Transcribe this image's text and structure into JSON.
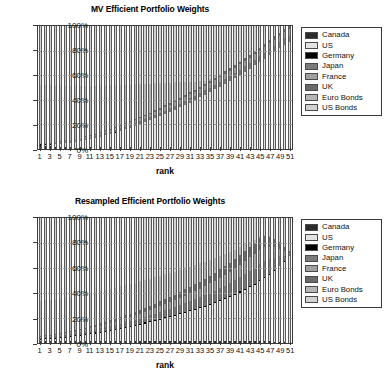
{
  "figure": {
    "xlabel": "rank",
    "yticks": [
      "0%",
      "20%",
      "40%",
      "60%",
      "80%",
      "100%"
    ],
    "xticks": [
      "1",
      "3",
      "5",
      "7",
      "9",
      "11",
      "13",
      "15",
      "17",
      "19",
      "21",
      "23",
      "25",
      "27",
      "29",
      "31",
      "33",
      "35",
      "37",
      "39",
      "41",
      "43",
      "45",
      "47",
      "49",
      "51"
    ],
    "legend_labels": [
      "Canada",
      "US",
      "Germany",
      "Japan",
      "France",
      "UK",
      "Euro Bonds",
      "US Bonds"
    ],
    "legend_colors": [
      "#2b2b2b",
      "#e3e3e3",
      "#000000",
      "#7a7a7a",
      "#a0a0a0",
      "#6a6a6a",
      "#b5b5b5",
      "#d2d2d2"
    ]
  },
  "chart_data": [
    {
      "type": "bar",
      "stacked": true,
      "title": "MV Efficient Portfolio Weights",
      "xlabel": "rank",
      "ylabel": "",
      "ylim": [
        0,
        100
      ],
      "yticks": [
        0,
        20,
        40,
        60,
        80,
        100
      ],
      "ytick_labels": [
        "0%",
        "20%",
        "40%",
        "60%",
        "80%",
        "100%"
      ],
      "grid": true,
      "legend_position": "right-outside",
      "x": [
        1,
        2,
        3,
        4,
        5,
        6,
        7,
        8,
        9,
        10,
        11,
        12,
        13,
        14,
        15,
        16,
        17,
        18,
        19,
        20,
        21,
        22,
        23,
        24,
        25,
        26,
        27,
        28,
        29,
        30,
        31,
        32,
        33,
        34,
        35,
        36,
        37,
        38,
        39,
        40,
        41,
        42,
        43,
        44,
        45,
        46,
        47,
        48,
        49,
        50,
        51
      ],
      "series": [
        {
          "name": "Canada",
          "color": "#2b2b2b",
          "values": [
            3.0,
            2.6,
            2.3,
            2.0,
            1.7,
            1.4,
            1.1,
            0.8,
            0.5,
            0.3,
            0.1,
            0,
            0,
            0,
            0,
            0,
            0,
            0,
            0,
            0,
            0,
            0,
            0,
            0,
            0,
            0,
            0,
            0,
            0,
            0,
            0,
            0,
            0,
            0,
            0,
            0,
            0,
            0,
            0,
            0,
            0,
            0,
            0,
            0,
            0,
            0,
            0,
            0,
            0,
            0,
            0
          ]
        },
        {
          "name": "US",
          "color": "#e3e3e3",
          "values": [
            0.6,
            0.9,
            1.3,
            1.8,
            2.4,
            3.1,
            3.9,
            4.8,
            5.7,
            6.7,
            7.7,
            8.8,
            9.9,
            11.0,
            12.2,
            13.4,
            14.7,
            16.0,
            17.4,
            18.8,
            20.3,
            21.8,
            23.4,
            25.0,
            26.7,
            28.4,
            30.2,
            32.0,
            33.9,
            35.8,
            37.8,
            39.8,
            41.9,
            44.0,
            46.2,
            48.4,
            50.7,
            53.0,
            55.4,
            57.8,
            60.3,
            62.8,
            65.4,
            68.0,
            70.7,
            73.4,
            76.2,
            79.0,
            81.9,
            84.8,
            87.8
          ]
        },
        {
          "name": "Germany",
          "color": "#000000",
          "values": [
            0.4,
            0.4,
            0.4,
            0.4,
            0.4,
            0.4,
            0.3,
            0.3,
            0.3,
            0.3,
            0.2,
            0.2,
            0.2,
            0.2,
            0.2,
            0.1,
            0.1,
            0.1,
            0.1,
            0.1,
            0,
            0,
            0,
            0,
            0,
            0,
            0,
            0,
            0,
            0,
            0,
            0,
            0,
            0,
            0,
            0,
            0,
            0,
            0,
            0,
            0,
            0,
            0,
            0,
            0,
            0,
            0,
            0,
            0,
            0,
            0
          ]
        },
        {
          "name": "Japan",
          "color": "#7a7a7a",
          "values": [
            0.3,
            0.4,
            0.5,
            0.6,
            0.7,
            0.8,
            0.9,
            1.0,
            1.1,
            1.2,
            1.3,
            1.4,
            1.5,
            1.6,
            1.7,
            1.8,
            1.9,
            2.0,
            2.1,
            2.2,
            2.3,
            2.4,
            2.5,
            2.6,
            2.7,
            2.8,
            2.9,
            3.0,
            3.1,
            3.2,
            3.3,
            3.4,
            3.5,
            3.6,
            3.7,
            3.8,
            3.9,
            4.0,
            4.1,
            4.2,
            4.3,
            4.4,
            4.5,
            4.6,
            4.7,
            4.8,
            4.9,
            5.0,
            5.1,
            5.2,
            5.3
          ]
        },
        {
          "name": "France",
          "color": "#a0a0a0",
          "values": [
            0.3,
            0.4,
            0.5,
            0.6,
            0.7,
            0.8,
            0.9,
            1.0,
            1.1,
            1.2,
            1.3,
            1.4,
            1.5,
            1.6,
            1.7,
            1.8,
            1.9,
            2.0,
            2.1,
            2.2,
            2.3,
            2.4,
            2.5,
            2.6,
            2.7,
            2.8,
            2.9,
            3.0,
            3.1,
            3.2,
            3.3,
            3.4,
            3.5,
            3.6,
            3.7,
            3.8,
            3.9,
            4.0,
            4.1,
            4.2,
            4.3,
            4.4,
            4.5,
            4.6,
            4.7,
            4.8,
            4.9,
            5.0,
            5.1,
            5.2,
            5.3
          ]
        },
        {
          "name": "UK",
          "color": "#6a6a6a",
          "values": [
            0.2,
            0.3,
            0.3,
            0.4,
            0.4,
            0.5,
            0.5,
            0.6,
            0.6,
            0.7,
            0.7,
            0.8,
            0.8,
            0.9,
            0.9,
            1.0,
            1.0,
            1.1,
            1.1,
            1.2,
            1.2,
            1.3,
            1.3,
            1.4,
            1.4,
            1.5,
            1.5,
            1.6,
            1.6,
            1.7,
            1.7,
            1.8,
            1.8,
            1.9,
            1.9,
            2.0,
            2.0,
            2.1,
            2.1,
            2.2,
            2.2,
            2.3,
            2.3,
            2.4,
            2.4,
            2.5,
            2.5,
            2.6,
            2.6,
            2.7,
            2.7
          ]
        },
        {
          "name": "Euro Bonds",
          "color": "#b5b5b5",
          "values": [
            47.6,
            47.0,
            46.4,
            45.7,
            45.0,
            44.2,
            43.4,
            42.5,
            41.6,
            40.6,
            39.6,
            38.5,
            37.4,
            36.2,
            35.0,
            33.7,
            32.4,
            31.0,
            29.6,
            28.1,
            26.6,
            25.0,
            23.4,
            21.7,
            20.0,
            18.2,
            16.4,
            14.5,
            12.6,
            10.6,
            8.6,
            6.5,
            4.4,
            2.3,
            1.4,
            1.0,
            0.8,
            0.6,
            0.4,
            0.3,
            0.2,
            0.1,
            0.1,
            0,
            0,
            0,
            0,
            0,
            0,
            0,
            0
          ]
        },
        {
          "name": "US Bonds",
          "color": "#d2d2d2",
          "values": [
            47.6,
            48.0,
            48.3,
            48.5,
            48.7,
            48.8,
            48.9,
            49.0,
            49.1,
            49.0,
            49.1,
            49.0,
            48.7,
            48.5,
            48.3,
            48.2,
            48.0,
            47.8,
            47.6,
            47.4,
            47.3,
            47.1,
            46.9,
            46.7,
            46.5,
            46.3,
            46.1,
            45.9,
            45.7,
            45.5,
            45.3,
            45.1,
            44.9,
            44.6,
            43.1,
            41.0,
            38.6,
            36.3,
            33.9,
            31.3,
            28.7,
            26.0,
            23.3,
            20.4,
            17.5,
            14.5,
            11.5,
            8.4,
            5.3,
            2.1,
            0.0
          ]
        }
      ]
    },
    {
      "type": "bar",
      "stacked": true,
      "title": "Resampled Efficient Portfolio Weights",
      "xlabel": "rank",
      "ylabel": "",
      "ylim": [
        0,
        100
      ],
      "yticks": [
        0,
        20,
        40,
        60,
        80,
        100
      ],
      "ytick_labels": [
        "0%",
        "20%",
        "40%",
        "60%",
        "80%",
        "100%"
      ],
      "grid": true,
      "legend_position": "right-outside",
      "x": [
        1,
        2,
        3,
        4,
        5,
        6,
        7,
        8,
        9,
        10,
        11,
        12,
        13,
        14,
        15,
        16,
        17,
        18,
        19,
        20,
        21,
        22,
        23,
        24,
        25,
        26,
        27,
        28,
        29,
        30,
        31,
        32,
        33,
        34,
        35,
        36,
        37,
        38,
        39,
        40,
        41,
        42,
        43,
        44,
        45,
        46,
        47,
        48,
        49,
        50,
        51
      ],
      "series": [
        {
          "name": "Canada",
          "color": "#2b2b2b",
          "values": [
            1.6,
            1.6,
            1.6,
            1.6,
            1.6,
            1.6,
            1.6,
            1.6,
            1.6,
            1.6,
            1.6,
            1.6,
            1.6,
            1.6,
            1.6,
            1.6,
            1.6,
            1.6,
            1.6,
            1.6,
            1.6,
            1.6,
            1.6,
            1.6,
            1.6,
            1.6,
            1.6,
            1.6,
            1.6,
            1.6,
            1.6,
            1.6,
            1.6,
            1.6,
            1.6,
            1.6,
            1.6,
            1.6,
            1.6,
            1.6,
            1.6,
            1.6,
            1.6,
            1.6,
            1.5,
            1.4,
            1.3,
            1.1,
            0.9,
            0.6,
            0.3
          ]
        },
        {
          "name": "US",
          "color": "#e3e3e3",
          "values": [
            1.0,
            1.3,
            1.6,
            1.9,
            2.3,
            2.7,
            3.2,
            3.7,
            4.2,
            4.8,
            5.4,
            6.0,
            6.7,
            7.4,
            8.1,
            8.9,
            9.7,
            10.5,
            11.3,
            12.2,
            13.1,
            14.0,
            15.0,
            16.0,
            17.0,
            18.0,
            19.1,
            20.2,
            21.3,
            22.5,
            23.7,
            24.9,
            26.2,
            27.5,
            28.9,
            30.3,
            31.8,
            33.4,
            35.1,
            36.9,
            38.8,
            40.8,
            43.0,
            45.3,
            47.8,
            50.5,
            53.5,
            56.8,
            60.5,
            64.6,
            69.2
          ]
        },
        {
          "name": "Germany",
          "color": "#000000",
          "values": [
            0.9,
            0.9,
            0.9,
            0.9,
            0.9,
            0.9,
            0.9,
            0.9,
            0.9,
            0.9,
            0.9,
            0.9,
            0.9,
            0.9,
            0.9,
            0.9,
            0.9,
            0.9,
            0.9,
            0.9,
            0.9,
            0.9,
            0.9,
            0.9,
            0.9,
            0.9,
            0.9,
            0.9,
            0.9,
            0.9,
            0.9,
            0.9,
            0.9,
            0.9,
            0.9,
            0.9,
            0.9,
            0.9,
            0.9,
            0.9,
            0.9,
            0.9,
            0.9,
            0.8,
            0.8,
            0.7,
            0.6,
            0.5,
            0.4,
            0.2,
            0.1
          ]
        },
        {
          "name": "Japan",
          "color": "#7a7a7a",
          "values": [
            0.8,
            0.9,
            1.0,
            1.1,
            1.2,
            1.3,
            1.5,
            1.6,
            1.8,
            1.9,
            2.1,
            2.3,
            2.5,
            2.7,
            2.9,
            3.1,
            3.3,
            3.5,
            3.8,
            4.0,
            4.3,
            4.5,
            4.8,
            5.1,
            5.4,
            5.7,
            6.0,
            6.3,
            6.6,
            7.0,
            7.3,
            7.7,
            8.0,
            8.4,
            8.8,
            9.2,
            9.6,
            10.0,
            10.5,
            10.9,
            11.4,
            11.9,
            12.4,
            12.9,
            13.4,
            13.2,
            12.0,
            10.0,
            7.5,
            4.5,
            1.5
          ]
        },
        {
          "name": "France",
          "color": "#a0a0a0",
          "values": [
            0.7,
            0.8,
            0.9,
            1.0,
            1.1,
            1.2,
            1.3,
            1.4,
            1.6,
            1.7,
            1.9,
            2.0,
            2.2,
            2.4,
            2.5,
            2.7,
            2.9,
            3.1,
            3.3,
            3.5,
            3.7,
            3.9,
            4.2,
            4.4,
            4.6,
            4.9,
            5.2,
            5.4,
            5.7,
            6.0,
            6.3,
            6.6,
            6.9,
            7.2,
            7.6,
            7.9,
            8.3,
            8.6,
            9.0,
            9.4,
            9.8,
            10.2,
            10.6,
            11.0,
            11.2,
            10.8,
            9.8,
            8.2,
            6.2,
            3.8,
            1.3
          ]
        },
        {
          "name": "UK",
          "color": "#6a6a6a",
          "values": [
            0.6,
            0.7,
            0.7,
            0.8,
            0.9,
            1.0,
            1.1,
            1.2,
            1.3,
            1.4,
            1.5,
            1.7,
            1.8,
            1.9,
            2.1,
            2.2,
            2.4,
            2.5,
            2.7,
            2.9,
            3.0,
            3.2,
            3.4,
            3.6,
            3.8,
            4.0,
            4.2,
            4.4,
            4.7,
            4.9,
            5.1,
            5.4,
            5.6,
            5.9,
            6.2,
            6.4,
            6.7,
            7.0,
            7.3,
            7.6,
            8.0,
            8.3,
            8.6,
            8.9,
            9.1,
            8.8,
            8.0,
            6.7,
            5.0,
            3.1,
            1.1
          ]
        },
        {
          "name": "Euro Bonds",
          "color": "#b5b5b5",
          "values": [
            28.2,
            28.2,
            28.1,
            28.0,
            27.9,
            27.8,
            27.6,
            27.4,
            27.2,
            27.0,
            26.7,
            26.4,
            26.1,
            25.8,
            25.4,
            25.0,
            24.6,
            24.2,
            23.7,
            23.2,
            22.7,
            22.2,
            21.6,
            21.0,
            20.4,
            19.8,
            19.1,
            18.4,
            17.7,
            16.9,
            16.1,
            15.3,
            14.5,
            13.6,
            12.7,
            11.8,
            10.8,
            9.8,
            8.7,
            7.6,
            6.4,
            5.2,
            4.0,
            2.7,
            1.6,
            0.9,
            0.5,
            0.3,
            0.1,
            0.0,
            0.0
          ]
        },
        {
          "name": "US Bonds",
          "color": "#d2d2d2",
          "values": [
            66.2,
            65.6,
            65.2,
            64.7,
            64.1,
            63.5,
            62.8,
            62.2,
            61.4,
            60.7,
            59.9,
            59.1,
            58.2,
            57.3,
            56.5,
            55.6,
            54.6,
            53.7,
            52.7,
            51.7,
            50.7,
            49.7,
            48.5,
            47.4,
            46.3,
            45.1,
            43.9,
            42.8,
            41.5,
            40.2,
            39.0,
            37.6,
            36.3,
            35.1,
            33.3,
            31.9,
            30.3,
            28.7,
            26.9,
            25.3,
            23.1,
            20.9,
            18.9,
            17.4,
            14.6,
            13.7,
            14.3,
            16.4,
            19.4,
            23.2,
            26.5
          ]
        }
      ]
    }
  ]
}
